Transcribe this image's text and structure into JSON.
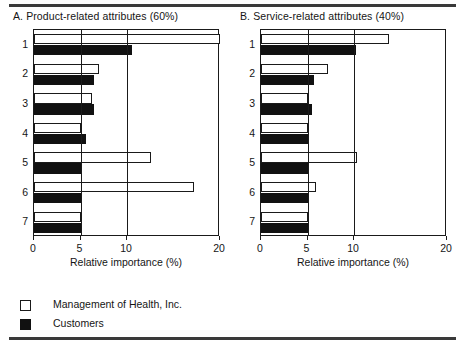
{
  "figure": {
    "legend": {
      "entries": [
        {
          "key": "mgmt",
          "label": "Management of Health, Inc.",
          "color": "#ffffff"
        },
        {
          "key": "cust",
          "label": "Customers",
          "color": "#111111"
        }
      ]
    }
  },
  "chart_data": [
    {
      "id": "panel-a",
      "type": "bar",
      "orientation": "horizontal",
      "title": "A. Product-related attributes (60%)",
      "xlabel": "Relative importance (%)",
      "ylabel": "",
      "categories": [
        "1",
        "2",
        "3",
        "4",
        "5",
        "6",
        "7"
      ],
      "xlim": [
        0,
        20
      ],
      "xticks": [
        0,
        5,
        10,
        20
      ],
      "xticklabels": [
        "0",
        "5",
        "10",
        "20"
      ],
      "grid": true,
      "legend_position": "below-figure",
      "series": [
        {
          "name": "Management of Health, Inc.",
          "color": "#ffffff",
          "values": [
            20.0,
            7.0,
            6.2,
            5.0,
            12.6,
            17.2,
            5.0
          ]
        },
        {
          "name": "Customers",
          "color": "#111111",
          "values": [
            10.5,
            6.4,
            6.5,
            5.6,
            5.0,
            5.0,
            5.0
          ]
        }
      ]
    },
    {
      "id": "panel-b",
      "type": "bar",
      "orientation": "horizontal",
      "title": "B. Service-related attributes (40%)",
      "xlabel": "Relative importance (%)",
      "ylabel": "",
      "categories": [
        "1",
        "2",
        "3",
        "4",
        "5",
        "6",
        "7"
      ],
      "xlim": [
        0,
        20
      ],
      "xticks": [
        0,
        5,
        10,
        20
      ],
      "xticklabels": [
        "0",
        "5",
        "10",
        "20"
      ],
      "grid": true,
      "legend_position": "below-figure",
      "series": [
        {
          "name": "Management of Health, Inc.",
          "color": "#ffffff",
          "values": [
            13.8,
            7.2,
            5.0,
            5.0,
            10.3,
            5.9,
            5.0
          ]
        },
        {
          "name": "Customers",
          "color": "#111111",
          "values": [
            10.2,
            5.7,
            5.5,
            5.2,
            5.0,
            5.0,
            5.0
          ]
        }
      ]
    }
  ]
}
